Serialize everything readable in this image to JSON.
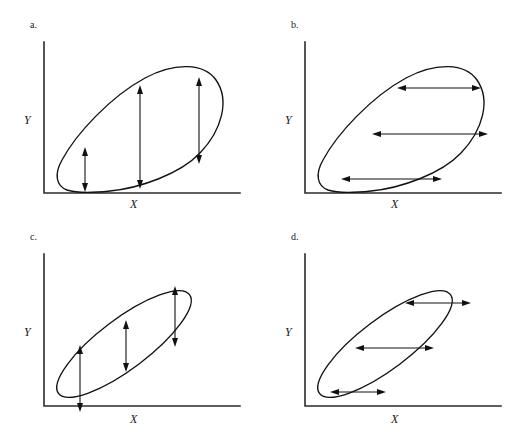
{
  "figure": {
    "background_color": "#ffffff",
    "stroke_color": "#111111",
    "axis_color": "#2b2b2b",
    "width": 522,
    "height": 439
  },
  "panels": [
    {
      "id": "a",
      "letter": "a.",
      "x_axis_label": "X",
      "y_axis_label": "Y",
      "envelope_shape": "teardrop",
      "spread_direction": "vertical",
      "spread_description": "vertical spread increases then decreases from left to right",
      "arrow_count": 3,
      "arrow_orientation": "vertical",
      "arrows": [
        {
          "index": 1,
          "x": 85,
          "y_top": 150,
          "y_bottom": 190,
          "length": 40
        },
        {
          "index": 2,
          "x": 140,
          "y_top": 88,
          "y_bottom": 187,
          "length": 99
        },
        {
          "index": 3,
          "x": 199,
          "y_top": 80,
          "y_bottom": 162,
          "length": 82
        }
      ]
    },
    {
      "id": "b",
      "letter": "b.",
      "x_axis_label": "X",
      "y_axis_label": "Y",
      "envelope_shape": "teardrop",
      "spread_direction": "horizontal",
      "spread_description": "horizontal spread varies across levels of Y",
      "arrow_count": 3,
      "arrow_orientation": "horizontal",
      "arrows": [
        {
          "index": 1,
          "y": 88,
          "x_left": 400,
          "x_right": 478,
          "length": 78
        },
        {
          "index": 2,
          "y": 134,
          "x_left": 372,
          "x_right": 488,
          "length": 116
        },
        {
          "index": 3,
          "y": 179,
          "x_left": 341,
          "x_right": 442,
          "length": 101
        }
      ]
    },
    {
      "id": "c",
      "letter": "c.",
      "x_axis_label": "X",
      "y_axis_label": "Y",
      "envelope_shape": "tilted-ellipse",
      "spread_direction": "vertical",
      "spread_description": "vertical spread is approximately constant across X",
      "arrow_count": 3,
      "arrow_orientation": "vertical",
      "arrows": [
        {
          "index": 1,
          "x": 80,
          "y_top": 347,
          "y_bottom": 410,
          "length": 63
        },
        {
          "index": 2,
          "x": 126,
          "y_top": 322,
          "y_bottom": 370,
          "length": 48
        },
        {
          "index": 3,
          "x": 175,
          "y_top": 288,
          "y_bottom": 345,
          "length": 57
        }
      ]
    },
    {
      "id": "d",
      "letter": "d.",
      "x_axis_label": "X",
      "y_axis_label": "Y",
      "envelope_shape": "tilted-ellipse",
      "spread_direction": "horizontal",
      "spread_description": "horizontal spread is approximately constant across Y",
      "arrow_count": 3,
      "arrow_orientation": "horizontal",
      "arrows": [
        {
          "index": 1,
          "y": 303,
          "x_left": 405,
          "x_right": 467,
          "length": 62
        },
        {
          "index": 2,
          "y": 348,
          "x_left": 355,
          "x_right": 430,
          "length": 75
        },
        {
          "index": 3,
          "y": 392,
          "x_left": 330,
          "x_right": 385,
          "length": 55
        }
      ]
    }
  ]
}
